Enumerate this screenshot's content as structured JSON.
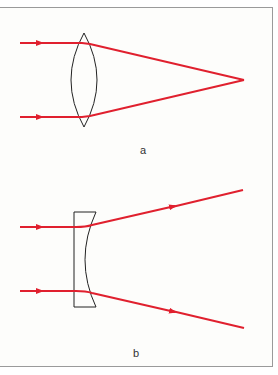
{
  "figure": {
    "panels": [
      {
        "label": "a",
        "lens_type": "converging (biconvex)",
        "ray_color": "#e0202e"
      },
      {
        "label": "b",
        "lens_type": "diverging (plano-concave)",
        "ray_color": "#e0202e"
      }
    ]
  }
}
